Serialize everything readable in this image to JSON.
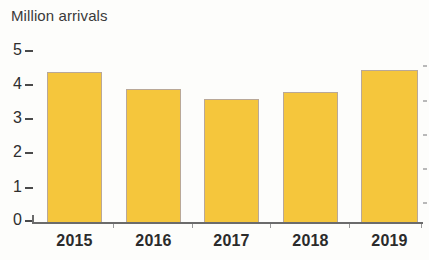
{
  "chart_data": {
    "type": "bar",
    "title": "Million arrivals",
    "xlabel": "",
    "ylabel": "Million arrivals",
    "categories": [
      "2015",
      "2016",
      "2017",
      "2018",
      "2019"
    ],
    "values": [
      4.4,
      3.9,
      3.6,
      3.8,
      4.45
    ],
    "ylim": [
      0,
      5
    ],
    "yticks": [
      "0",
      "1",
      "2",
      "3",
      "4",
      "5"
    ],
    "ytick_values": [
      0,
      1,
      2,
      3,
      4,
      5
    ],
    "grid": false,
    "legend": null,
    "series": [
      {
        "name": "Million arrivals",
        "values": [
          4.4,
          3.9,
          3.6,
          3.8,
          4.45
        ]
      }
    ]
  },
  "style": {
    "bar_fill": "#f5c63c",
    "bar_border": "#b9a898",
    "axis_color": "#6b6b6b",
    "text_color": "#2b2b2b",
    "title_color": "#3a3a3a",
    "background": "#fdfdfb"
  }
}
